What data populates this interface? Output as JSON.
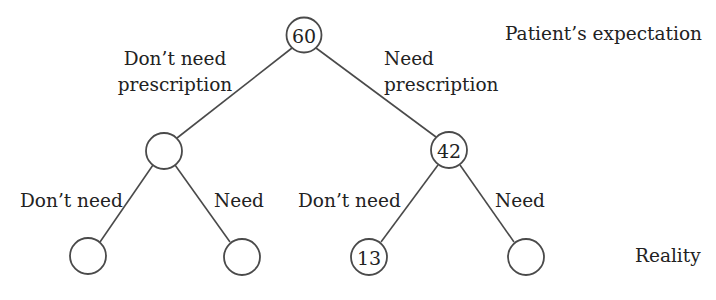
{
  "diagram": {
    "type": "probability-tree",
    "level_labels": {
      "top": "Patient’s expectation",
      "bottom": "Reality"
    },
    "nodes": {
      "root": {
        "value": "60"
      },
      "left": {
        "value": ""
      },
      "right": {
        "value": "42"
      },
      "left_left": {
        "value": ""
      },
      "left_right": {
        "value": ""
      },
      "right_left": {
        "value": "13"
      },
      "right_right": {
        "value": ""
      }
    },
    "edges": {
      "root_left": {
        "label_line1": "Don’t need",
        "label_line2": "prescription"
      },
      "root_right": {
        "label_line1": "Need",
        "label_line2": "prescription"
      },
      "left_left": {
        "label": "Don’t need"
      },
      "left_right": {
        "label": "Need"
      },
      "right_left": {
        "label": "Don’t need"
      },
      "right_right": {
        "label": "Need"
      }
    }
  }
}
